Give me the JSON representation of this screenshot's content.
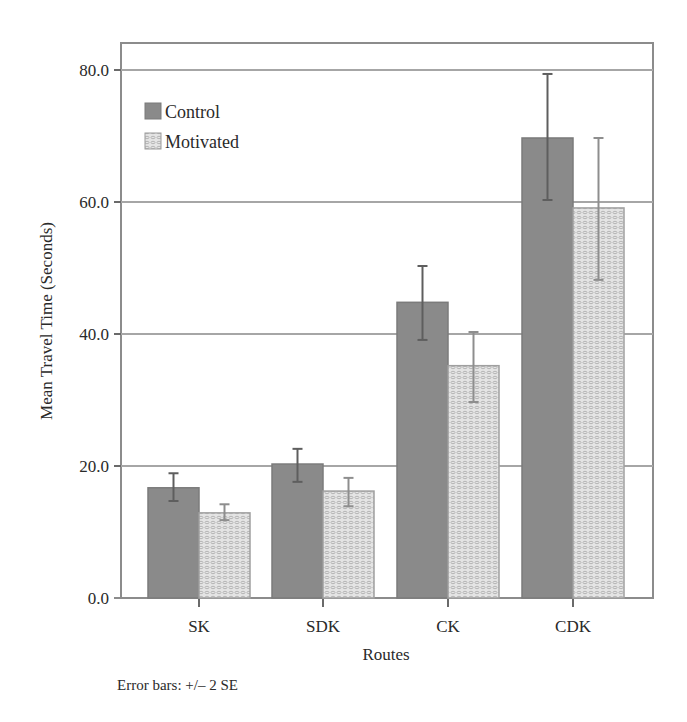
{
  "chart_data": {
    "type": "bar",
    "title": "",
    "xlabel": "Routes",
    "ylabel": "Mean Travel Time (Seconds)",
    "categories": [
      "SK",
      "SDK",
      "CK",
      "CDK"
    ],
    "ylim": [
      0,
      80
    ],
    "yticks": [
      "0.0",
      "20.0",
      "40.0",
      "60.0",
      "80.0"
    ],
    "grid": true,
    "legend_position": "upper-left",
    "series": [
      {
        "name": "Control",
        "color": "#8a8a8a",
        "pattern": "solid",
        "values": [
          16.7,
          20.3,
          44.8,
          69.7
        ],
        "error_low": [
          14.7,
          17.6,
          39.1,
          60.3
        ],
        "error_high": [
          18.9,
          22.6,
          50.3,
          79.4
        ]
      },
      {
        "name": "Motivated",
        "color": "#e2e2e2",
        "pattern": "dotted",
        "values": [
          12.9,
          16.2,
          35.2,
          59.1
        ],
        "error_low": [
          11.8,
          13.9,
          29.7,
          48.2
        ],
        "error_high": [
          14.2,
          18.2,
          40.3,
          69.7
        ]
      }
    ],
    "annotations": [
      "Error bars: +/– 2 SE"
    ]
  },
  "legend": {
    "items": [
      {
        "label": "Control"
      },
      {
        "label": "Motivated"
      }
    ]
  },
  "footnote": "Error bars: +/– 2 SE"
}
